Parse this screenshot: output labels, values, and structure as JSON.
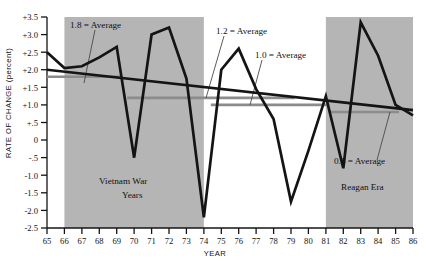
{
  "chart_data": {
    "type": "line",
    "title": "",
    "xlabel": "YEAR",
    "ylabel": "RATE OF CHANGE (percent)",
    "xlim": [
      65,
      86
    ],
    "ylim": [
      -2.5,
      3.5
    ],
    "grid": false,
    "legend": "none",
    "x": [
      65,
      66,
      67,
      68,
      69,
      70,
      71,
      72,
      73,
      74,
      75,
      76,
      77,
      78,
      79,
      80,
      81,
      82,
      83,
      84,
      85,
      86
    ],
    "xtick_labels": [
      "65",
      "66",
      "67",
      "68",
      "69",
      "70",
      "71",
      "72",
      "73",
      "74",
      "75",
      "76",
      "77",
      "78",
      "79",
      "80",
      "81",
      "82",
      "83",
      "84",
      "85",
      "86"
    ],
    "ytick_labels": [
      "+3.5",
      "+3.0",
      "+2.5",
      "+2.0",
      "+1.5",
      "+1.0",
      "+.5",
      "0",
      "-.5",
      "-1.0",
      "-1.5",
      "-2.0",
      "-2.5"
    ],
    "ytick_values": [
      3.5,
      3.0,
      2.5,
      2.0,
      1.5,
      1.0,
      0.5,
      0,
      -0.5,
      -1.0,
      -1.5,
      -2.0,
      -2.5
    ],
    "series": [
      {
        "name": "Rate of change",
        "values": [
          2.5,
          2.05,
          2.1,
          2.35,
          2.65,
          -0.5,
          3.0,
          3.2,
          1.75,
          -2.2,
          2.0,
          2.6,
          1.45,
          0.6,
          -1.75,
          -0.3,
          1.25,
          -0.8,
          3.35,
          2.4,
          1.0,
          0.7
        ]
      }
    ],
    "trend_line": {
      "name": "overall declining trend",
      "x_start": 65,
      "y_start": 2.0,
      "x_end": 86,
      "y_end": 0.85
    },
    "average_segments": [
      {
        "label": "1.8 = Average",
        "value": 1.8,
        "x_start": 65,
        "x_end": 69.2
      },
      {
        "label": "1.2 = Average",
        "value": 1.2,
        "x_start": 69.6,
        "x_end": 79.2
      },
      {
        "label": "1.0 = Average",
        "value": 1.0,
        "x_start": 74.4,
        "x_end": 81.2
      },
      {
        "label": "0.8 = Average",
        "value": 0.8,
        "x_start": 81.2,
        "x_end": 85.2
      }
    ],
    "shaded_bands": [
      {
        "label": "Vietnam War Years",
        "x_start": 66,
        "x_end": 74
      },
      {
        "label": "Reagan Era",
        "x_start": 81,
        "x_end": 86
      }
    ],
    "annotations": [
      {
        "text": "1.8 = Average",
        "x": 70.5,
        "y": 24
      },
      {
        "text": "1.2 = Average",
        "x": 216,
        "y": 32
      },
      {
        "text": "1.0 = Average",
        "x": 255,
        "y": 56
      },
      {
        "text": "0.8 = Average",
        "x": 336,
        "y": 167
      },
      {
        "text": "Vietnam War",
        "x": 99,
        "y": 181
      },
      {
        "text": "Years",
        "x": 120,
        "y": 195
      },
      {
        "text": "Reagan Era",
        "x": 344,
        "y": 192
      }
    ],
    "colors": {
      "line": "#141414",
      "band_fill": "#b5b5b5",
      "average_segment": "#8c8c8c",
      "axis": "#141414",
      "background": "#ffffff"
    }
  },
  "axis": {
    "x_title": "YEAR",
    "y_title": "RATE OF CHANGE (percent)"
  },
  "bands": {
    "vietnam": "Vietnam War",
    "vietnam_second": "Years",
    "reagan": "Reagan Era"
  },
  "averages": {
    "a18": "1.8 = Average",
    "a12": "1.2 = Average",
    "a10": "1.0 = Average",
    "a08": "0.8 = Average"
  },
  "yticks": {
    "t0": "+3.5",
    "t1": "+3.0",
    "t2": "+2.5",
    "t3": "+2.0",
    "t4": "+1.5",
    "t5": "+1.0",
    "t6": "+.5",
    "t7": "0",
    "t8": "-.5",
    "t9": "-1.0",
    "t10": "-1.5",
    "t11": "-2.0",
    "t12": "-2.5"
  },
  "xticks": {
    "t0": "65",
    "t1": "66",
    "t2": "67",
    "t3": "68",
    "t4": "69",
    "t5": "70",
    "t6": "71",
    "t7": "72",
    "t8": "73",
    "t9": "74",
    "t10": "75",
    "t11": "76",
    "t12": "77",
    "t13": "78",
    "t14": "79",
    "t15": "80",
    "t16": "81",
    "t17": "82",
    "t18": "83",
    "t19": "84",
    "t20": "85",
    "t21": "86"
  }
}
